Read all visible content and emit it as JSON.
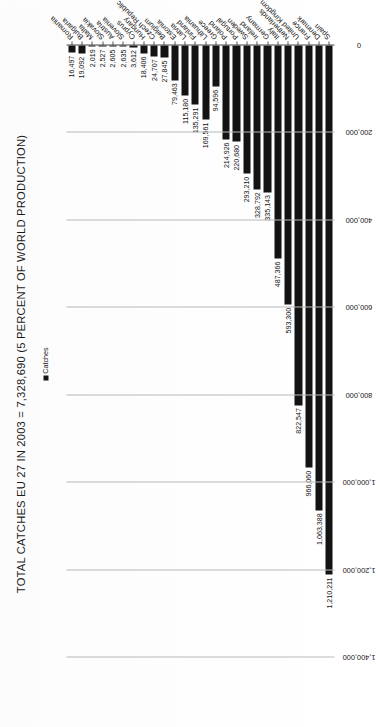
{
  "chart_data": {
    "type": "bar",
    "orientation": "vertical-rotated",
    "title": "TOTAL CATCHES EU 27 IN 2003 = 7,328,690 (5 PERCENT OF WORLD PRODUCTION)",
    "xlabel": "",
    "ylabel": "",
    "legend": [
      {
        "label": "Catches",
        "color": "#131313"
      }
    ],
    "legend_position": "top-right",
    "grid": true,
    "ylim": [
      0,
      1400000
    ],
    "yticks": [
      "1,400,000",
      "1,200,000",
      "1,000,000",
      "800,000",
      "600,000",
      "400,000",
      "200,000",
      "0"
    ],
    "ytick_values": [
      1400000,
      1200000,
      1000000,
      800000,
      600000,
      400000,
      200000,
      0
    ],
    "categories": [
      "Spain",
      "Denmark",
      "France",
      "United Kingdom",
      "Netherlands",
      "Italy",
      "Germany",
      "Ireland",
      "Sweden",
      "Portugal",
      "Poland",
      "Greece",
      "Lithuania",
      "Finland",
      "Latvia",
      "Estonia",
      "Belgium",
      "Czech Republic",
      "Hungary",
      "Cyprus",
      "Slovenia",
      "Austria",
      "Slovakia",
      "Malta",
      "Bulgaria",
      "Romania"
    ],
    "values": [
      1210211,
      1063388,
      966060,
      822547,
      593300,
      487366,
      335143,
      328792,
      293210,
      220680,
      214926,
      94596,
      169561,
      135291,
      115180,
      79463,
      27845,
      24707,
      18406,
      3612,
      2635,
      2605,
      2527,
      2019,
      19092,
      16497
    ],
    "value_labels": [
      "1,210,211",
      "1,063,388",
      "966,060",
      "822,547",
      "593,300",
      "487,366",
      "335,143",
      "328,792",
      "293,210",
      "220,680",
      "214,926",
      "94,596",
      "169,561",
      "135,291",
      "115,180",
      "79,463",
      "27,845",
      "24,707",
      "18,406",
      "3,612",
      "2,635",
      "2,605",
      "2,527",
      "2,019",
      "19,092",
      "16,497"
    ],
    "series": [
      {
        "name": "Catches",
        "values": [
          1210211,
          1063388,
          966060,
          822547,
          593300,
          487366,
          335143,
          328792,
          293210,
          220680,
          214926,
          94596,
          169561,
          135291,
          115180,
          79463,
          27845,
          24707,
          18406,
          3612,
          2635,
          2605,
          2527,
          2019,
          19092,
          16497
        ]
      }
    ]
  },
  "colors": {
    "bar": "#131313",
    "grid": "#b9b9b9",
    "axis": "#4a4a4a",
    "text": "#161616",
    "background": "#ffffff"
  }
}
